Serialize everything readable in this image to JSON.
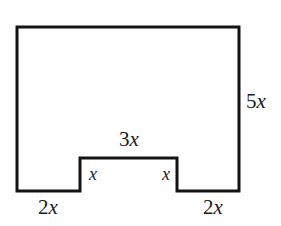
{
  "figure": {
    "kind": "polygon-diagram",
    "background_color": "#ffffff",
    "stroke_color": "#141414",
    "stroke_width": 3,
    "canvas": {
      "width": 281,
      "height": 226
    },
    "outline_points": "17,27 239,27 239,191 177,191 177,158 80,158 80,191 17,191",
    "labels": {
      "right_side": {
        "coefficient": "5",
        "variable": "x",
        "full": "5x"
      },
      "notch_top": {
        "coefficient": "3",
        "variable": "x",
        "full": "3x"
      },
      "notch_left_riser": {
        "coefficient": "",
        "variable": "x",
        "full": "x"
      },
      "notch_right_riser": {
        "coefficient": "",
        "variable": "x",
        "full": "x"
      },
      "bottom_left": {
        "coefficient": "2",
        "variable": "x",
        "full": "2x"
      },
      "bottom_right": {
        "coefficient": "2",
        "variable": "x",
        "full": "2x"
      }
    }
  }
}
